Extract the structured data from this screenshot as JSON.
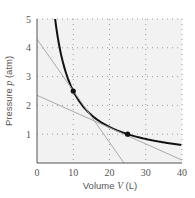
{
  "chart_data": {
    "type": "line",
    "title": "",
    "xlabel": "Volume V (L)",
    "ylabel": "Pressure p (atm)",
    "xlabel_parts": [
      "Volume ",
      "V",
      " (L)"
    ],
    "ylabel_parts": [
      "Pressure ",
      "p",
      " (atm)"
    ],
    "xlim": [
      0,
      40
    ],
    "ylim": [
      0,
      5
    ],
    "x_ticks": [
      0,
      10,
      20,
      30,
      40
    ],
    "y_ticks": [
      1,
      2,
      3,
      4,
      5
    ],
    "grid": "dotted",
    "series": [
      {
        "name": "isotherm",
        "function": "p = 25 / V",
        "color": "#111111",
        "x": [
          5,
          6,
          7,
          8,
          10,
          12.5,
          15,
          20,
          25,
          30,
          35,
          40
        ],
        "y": [
          5,
          4.17,
          3.57,
          3.13,
          2.5,
          2.0,
          1.67,
          1.25,
          1.0,
          0.83,
          0.71,
          0.63
        ]
      },
      {
        "name": "tangent-steep",
        "color": "#aaaaaa",
        "x": [
          0,
          24
        ],
        "y": [
          4.3,
          0
        ]
      },
      {
        "name": "tangent-shallow",
        "color": "#aaaaaa",
        "x": [
          0,
          40
        ],
        "y": [
          2.35,
          0.1
        ]
      }
    ],
    "points": [
      {
        "x": 10,
        "y": 2.5
      },
      {
        "x": 25,
        "y": 1.0
      }
    ]
  },
  "axis": {
    "x_tick_labels": [
      "0",
      "10",
      "20",
      "30",
      "40"
    ],
    "y_tick_labels": [
      "1",
      "2",
      "3",
      "4",
      "5"
    ]
  }
}
